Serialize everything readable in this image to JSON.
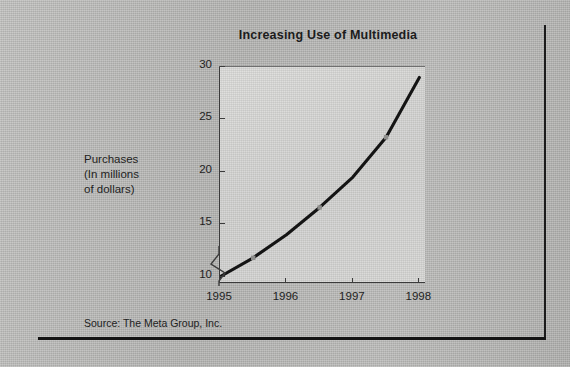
{
  "figure": {
    "title": "Increasing Use of Multimedia",
    "source": "Source: The Meta Group, Inc.",
    "y_axis_label_lines": [
      "Purchases",
      "(In millions",
      "of dollars)"
    ],
    "axis_break_present": true
  },
  "chart_data": {
    "type": "line",
    "title": "Increasing Use of Multimedia",
    "xlabel": "",
    "ylabel": "Purchases (In millions of dollars)",
    "x": [
      1995,
      1996,
      1997,
      1998
    ],
    "xtick_labels": [
      "1995",
      "1996",
      "1997",
      "1998"
    ],
    "ytick_labels": [
      "10",
      "15",
      "20",
      "25",
      "30"
    ],
    "ytick_values": [
      10,
      15,
      20,
      25,
      30
    ],
    "ylim": [
      9.3,
      30
    ],
    "xlim": [
      1995,
      1998.1
    ],
    "grid": false,
    "legend": false,
    "y_axis_broken_below": 10,
    "series": [
      {
        "name": "Purchases",
        "color": "#141414",
        "values": [
          10.0,
          14.0,
          19.5,
          29.0
        ],
        "points": [
          {
            "x": 1995.0,
            "y": 10.0
          },
          {
            "x": 1995.5,
            "y": 11.8
          },
          {
            "x": 1996.0,
            "y": 14.0
          },
          {
            "x": 1996.5,
            "y": 16.6
          },
          {
            "x": 1997.0,
            "y": 19.5
          },
          {
            "x": 1997.5,
            "y": 23.3
          },
          {
            "x": 1998.0,
            "y": 29.0
          }
        ],
        "marker_positions": [
          1995.5,
          1996.5,
          1997.5
        ]
      }
    ]
  }
}
